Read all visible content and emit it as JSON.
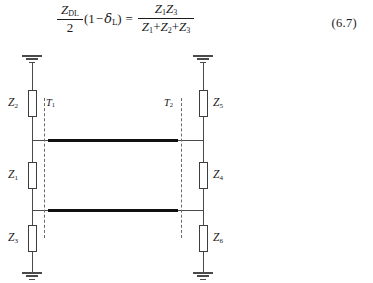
{
  "figure": {
    "equation": {
      "number": "(6.7)",
      "left": {
        "fraction": {
          "numerator": "Z",
          "numerator_sub": "DL",
          "denominator": "2"
        },
        "factor_open": "(",
        "factor_one": "1",
        "factor_minus": "−",
        "factor_delta": "δ",
        "factor_delta_sub": "L",
        "factor_close": ")"
      },
      "equals": "=",
      "right": {
        "numerator_terms": [
          {
            "sym": "Z",
            "sub": "1"
          },
          {
            "sym": "Z",
            "sub": "3"
          }
        ],
        "denominator_terms": [
          {
            "sym": "Z",
            "sub": "1"
          },
          {
            "sym": "Z",
            "sub": "2"
          },
          {
            "sym": "Z",
            "sub": "3"
          }
        ],
        "denominator_operator": "+"
      }
    },
    "circuit": {
      "left_branch": {
        "impedances": [
          {
            "id": "z2",
            "sym": "Z",
            "sub": "2"
          },
          {
            "id": "z1",
            "sym": "Z",
            "sub": "1"
          },
          {
            "id": "z3",
            "sym": "Z",
            "sub": "3"
          }
        ]
      },
      "right_branch": {
        "impedances": [
          {
            "id": "z5",
            "sym": "Z",
            "sub": "5"
          },
          {
            "id": "z4",
            "sym": "Z",
            "sub": "4"
          },
          {
            "id": "z6",
            "sym": "Z",
            "sub": "6"
          }
        ]
      },
      "reference_planes": [
        {
          "id": "t1",
          "sym": "T",
          "sub": "1"
        },
        {
          "id": "t2",
          "sym": "T",
          "sub": "2"
        }
      ],
      "grounds": [
        {
          "id": "gnd-top-left"
        },
        {
          "id": "gnd-top-right"
        },
        {
          "id": "gnd-bottom-left"
        },
        {
          "id": "gnd-bottom-right"
        }
      ],
      "transmission_lines": [
        {
          "id": "tline-upper"
        },
        {
          "id": "tline-lower"
        }
      ]
    },
    "colors": {
      "ink": "#1a1a1a",
      "wire": "#4a4a4a",
      "conductor": "#111111",
      "dashed_plane": "#6a6a6a",
      "background": "#ffffff"
    }
  }
}
